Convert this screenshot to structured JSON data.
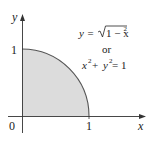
{
  "figure": {
    "region": {
      "description": "quarter unit disk in first quadrant",
      "fill_color": "#dcdcdc",
      "curve_color": "#555555",
      "x_range": [
        0,
        1
      ],
      "y_range": [
        0,
        1
      ]
    },
    "axes": {
      "x_label": "x",
      "y_label": "y",
      "origin_label": "0",
      "x_tick_label": "1",
      "y_tick_label": "1",
      "axis_color": "#333333"
    },
    "equation": {
      "line1_lhs": "y = ",
      "line1_sqrt_body": "1 − x",
      "line1_exp": "2",
      "line2": "or",
      "line3_a": "x",
      "line3_a_exp": "2",
      "line3_plus": " + ",
      "line3_b": "y",
      "line3_b_exp": "2",
      "line3_rhs": " = 1"
    }
  }
}
